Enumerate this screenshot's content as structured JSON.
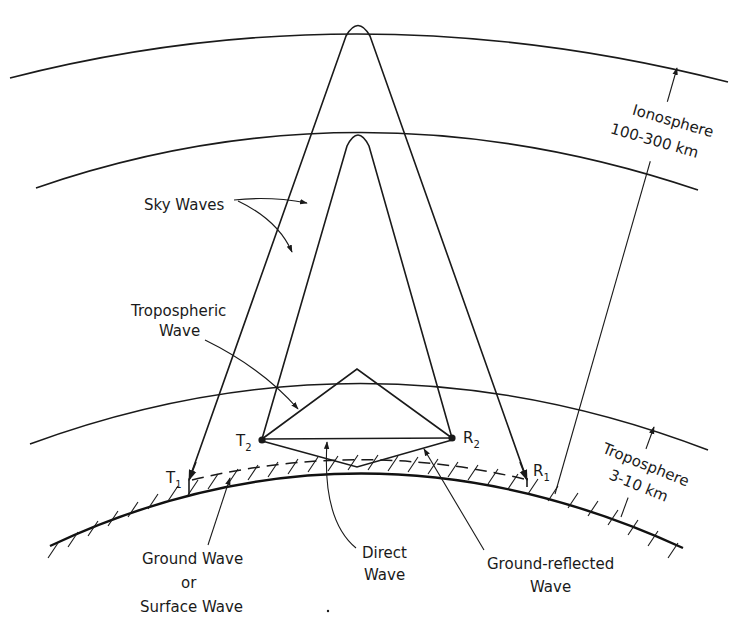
{
  "diagram": {
    "type": "radio wave propagation modes",
    "layers": {
      "ionosphere": {
        "name": "Ionosphere",
        "range": "100-300 km"
      },
      "troposphere": {
        "name": "Troposphere",
        "range": "3-10 km"
      }
    },
    "labels": {
      "sky_waves": "Sky Waves",
      "tropospheric_line1": "Tropospheric",
      "tropospheric_line2": "Wave",
      "ground_wave_line1": "Ground Wave",
      "ground_wave_line2": "or",
      "ground_wave_line3": "Surface Wave",
      "direct_line1": "Direct",
      "direct_line2": "Wave",
      "ground_reflected_line1": "Ground-reflected",
      "ground_reflected_line2": "Wave",
      "ionosphere_line1": "Ionosphere",
      "ionosphere_line2": "100-300 km",
      "troposphere_line1": "Troposphere",
      "troposphere_line2": "3-10 km"
    },
    "stations": {
      "t1": {
        "letter": "T",
        "sub": "1"
      },
      "t2": {
        "letter": "T",
        "sub": "2"
      },
      "r1": {
        "letter": "R",
        "sub": "1"
      },
      "r2": {
        "letter": "R",
        "sub": "2"
      }
    },
    "colors": {
      "ink": "#1a1a1a",
      "background": "#ffffff"
    }
  }
}
